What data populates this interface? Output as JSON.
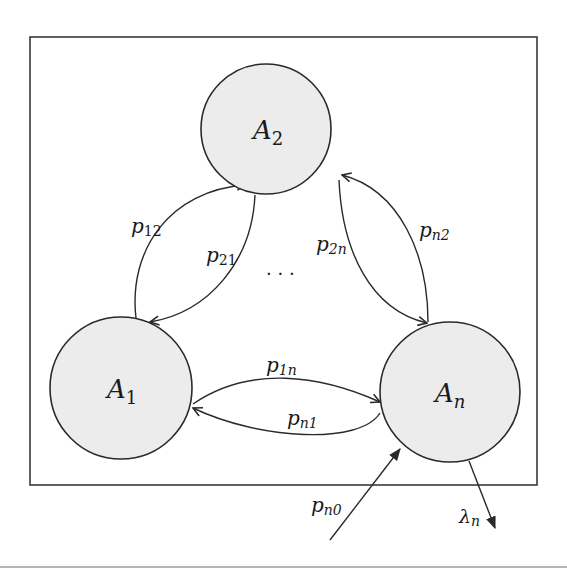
{
  "diagram": {
    "colors": {
      "node_fill": "#ececec",
      "stroke": "#2a2a2a",
      "background": "#ffffff"
    },
    "nodes": [
      {
        "id": "A1",
        "label": "A",
        "subscript": "1"
      },
      {
        "id": "A2",
        "label": "A",
        "subscript": "2"
      },
      {
        "id": "An",
        "label": "A",
        "subscript": "n"
      }
    ],
    "edges": [
      {
        "from": "A1",
        "to": "A2",
        "label": "p",
        "subscript": "12"
      },
      {
        "from": "A2",
        "to": "A1",
        "label": "p",
        "subscript": "21"
      },
      {
        "from": "A2",
        "to": "An",
        "label": "p",
        "subscript": "2n"
      },
      {
        "from": "An",
        "to": "A2",
        "label": "p",
        "subscript": "n2"
      },
      {
        "from": "A1",
        "to": "An",
        "label": "p",
        "subscript": "1n"
      },
      {
        "from": "An",
        "to": "A1",
        "label": "p",
        "subscript": "n1"
      },
      {
        "from": "outside",
        "to": "An",
        "label": "p",
        "subscript": "n0"
      },
      {
        "from": "An",
        "to": "outside",
        "label": "λ",
        "subscript": "n"
      }
    ],
    "ellipsis": "· · ·"
  }
}
